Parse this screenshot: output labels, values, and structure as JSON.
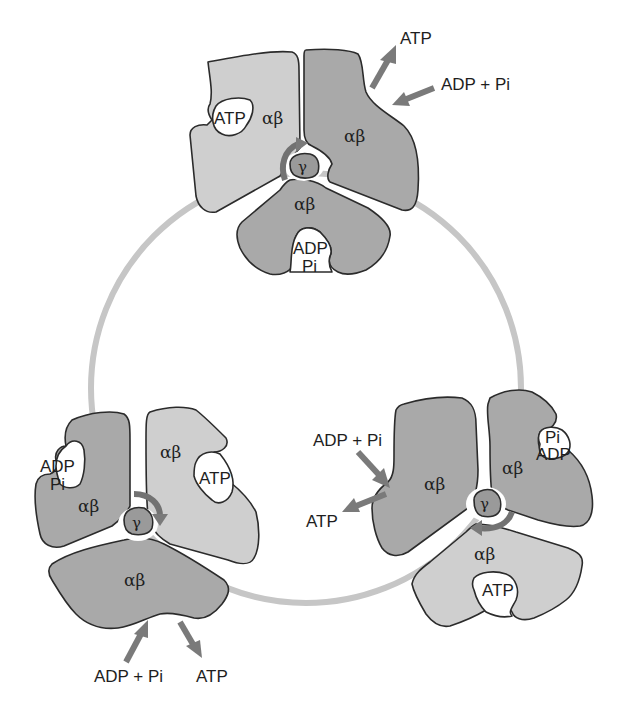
{
  "figure": {
    "colors": {
      "ring": "#c6c6c6",
      "subunit_dark": "#a9a9a9",
      "subunit_light": "#cfcfcf",
      "gamma": "#9a9a9a",
      "arrow": "#7a7a7a",
      "outline": "#2b2b2b"
    },
    "top_cluster": {
      "subunits": [
        {
          "label": "αβ",
          "shade": "light",
          "pocket": "ATP"
        },
        {
          "label": "αβ",
          "shade": "dark",
          "pocket": ""
        },
        {
          "label": "αβ",
          "shade": "dark",
          "pocket_line1": "ADP",
          "pocket_line2": "Pi"
        }
      ],
      "gamma": "γ",
      "arrows": {
        "out": "ATP",
        "in": "ADP + Pi"
      }
    },
    "left_cluster": {
      "subunits": [
        {
          "label": "αβ",
          "shade": "dark",
          "pocket_line1": "ADP",
          "pocket_line2": "Pi"
        },
        {
          "label": "αβ",
          "shade": "light",
          "pocket": "ATP"
        },
        {
          "label": "αβ",
          "shade": "dark",
          "pocket": ""
        }
      ],
      "gamma": "γ",
      "arrows": {
        "in": "ADP + Pi",
        "out": "ATP"
      }
    },
    "right_cluster": {
      "subunits": [
        {
          "label": "αβ",
          "shade": "dark",
          "pocket": ""
        },
        {
          "label": "αβ",
          "shade": "dark",
          "pocket_line1": "Pi",
          "pocket_line2": "ADP"
        },
        {
          "label": "αβ",
          "shade": "light",
          "pocket": "ATP"
        }
      ],
      "gamma": "γ",
      "arrows": {
        "in": "ADP + Pi",
        "out": "ATP"
      }
    }
  }
}
